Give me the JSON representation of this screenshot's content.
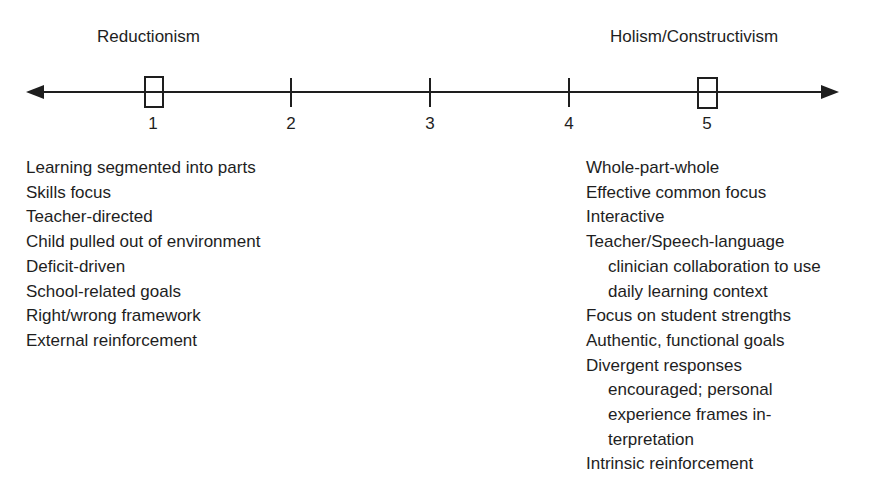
{
  "diagram": {
    "type": "continuum",
    "left_pole": {
      "label": "Reductionism",
      "position": 1
    },
    "right_pole": {
      "label": "Holism/Constructivism",
      "position": 5
    },
    "scale": {
      "ticks": [
        "1",
        "2",
        "3",
        "4",
        "5"
      ],
      "boxed_points": [
        "1",
        "5"
      ],
      "arrows": "both-ends"
    },
    "left_traits": [
      "Learning segmented into parts",
      "Skills focus",
      "Teacher-directed",
      "Child pulled out of environment",
      "Deficit-driven",
      "School-related goals",
      "Right/wrong framework",
      "External reinforcement"
    ],
    "right_traits": [
      {
        "lines": [
          "Whole-part-whole"
        ]
      },
      {
        "lines": [
          "Effective common focus"
        ]
      },
      {
        "lines": [
          "Interactive"
        ]
      },
      {
        "lines": [
          "Teacher/Speech-language",
          "clinician collaboration to use",
          "daily learning context"
        ]
      },
      {
        "lines": [
          "Focus on student strengths"
        ]
      },
      {
        "lines": [
          "Authentic, functional goals"
        ]
      },
      {
        "lines": [
          "Divergent responses",
          "encouraged; personal",
          "experience frames in-",
          "terpretation"
        ]
      },
      {
        "lines": [
          "Intrinsic reinforcement"
        ]
      }
    ]
  },
  "colors": {
    "ink": "#1e1e1e",
    "background": "#ffffff"
  }
}
